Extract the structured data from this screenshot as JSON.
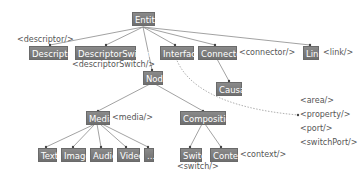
{
  "diagram": {
    "nodes": {
      "entity": "Entity",
      "descriptor": "Descriptor",
      "descriptor_switch": "DescriptorSwitch",
      "interface": "Interface",
      "connector": "Connector",
      "link": "Link",
      "node": "Node",
      "causal": "Causal",
      "media": "Media",
      "composition": "Composition",
      "text": "Text",
      "image": "Image",
      "audio": "Audio",
      "video": "Video",
      "more": "...",
      "switch": "Switch",
      "context": "Context"
    },
    "tags": {
      "descriptor": "<descriptor/>",
      "descriptor_switch": "<descriptorSwitch/>",
      "connector": "<connector/>",
      "link": "<link/>",
      "media": "<media/>",
      "switch": "<switch/>",
      "context": "<context/>",
      "interface_list": [
        "<area/>",
        "<property/>",
        "<port/>",
        "<switchPort/>"
      ]
    },
    "colors": {
      "node_fill": "#7d7d7d",
      "edge": "#888888",
      "tag_text": "#555555",
      "background": "#ffffff"
    }
  }
}
